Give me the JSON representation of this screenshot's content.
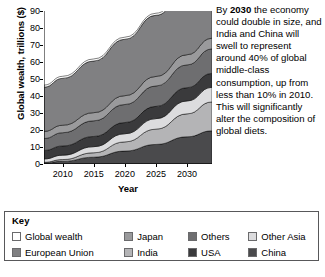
{
  "chart_data": {
    "type": "area",
    "title": "",
    "subtitle": "",
    "xlabel": "Year",
    "ylabel": "Global wealth, trillions ($)",
    "stacked": true,
    "grid": false,
    "legend_position": "bottom",
    "xlim": [
      2007,
      2034
    ],
    "ylim": [
      0,
      90
    ],
    "yticks": [
      0,
      10,
      20,
      30,
      40,
      50,
      60,
      70,
      80,
      90
    ],
    "ytick_labels": [
      "0",
      "10",
      "20",
      "30",
      "40",
      "50",
      "60",
      "70",
      "80",
      "90"
    ],
    "xticks": [
      2010,
      2015,
      2020,
      2025,
      2030
    ],
    "xtick_labels": [
      "2010",
      "2015",
      "2020",
      "2025",
      "2030"
    ],
    "x": [
      2007,
      2010,
      2015,
      2020,
      2025,
      2030,
      2034
    ],
    "series": [
      {
        "name": "China",
        "color": "#4a4a4c",
        "values": [
          0.6,
          1.6,
          4.0,
          7.6,
          11.5,
          16.0,
          19.5
        ]
      },
      {
        "name": "India",
        "color": "#b4b4b6",
        "values": [
          0.4,
          1.0,
          2.6,
          5.4,
          9.0,
          13.5,
          17.0
        ]
      },
      {
        "name": "Other Asia",
        "color": "#dcdcde",
        "values": [
          2.0,
          2.6,
          3.6,
          4.8,
          6.2,
          7.6,
          8.6
        ]
      },
      {
        "name": "USA",
        "color": "#3a3a3c",
        "values": [
          5.0,
          5.4,
          6.0,
          6.6,
          7.2,
          7.8,
          8.2
        ]
      },
      {
        "name": "Others",
        "color": "#6e6e70",
        "values": [
          7.0,
          7.8,
          9.2,
          10.6,
          12.0,
          13.4,
          14.4
        ]
      },
      {
        "name": "Japan",
        "color": "#9a9a9c",
        "values": [
          4.2,
          4.4,
          4.8,
          5.2,
          5.6,
          6.0,
          6.3
        ]
      },
      {
        "name": "European Union",
        "color": "#808082",
        "values": [
          26.0,
          27.6,
          30.4,
          33.2,
          36.0,
          38.8,
          40.8
        ]
      },
      {
        "name": "Global wealth",
        "color": "#ffffff",
        "values": [
          1.2,
          1.2,
          1.2,
          1.2,
          1.2,
          1.2,
          1.2
        ]
      }
    ],
    "annotation": "By 2030 the economy could double in size, and India and China will swell to represent around 40% of global middle-class consumption, up from less than 10% in 2010. This will significantly alter the composition of global diets."
  },
  "annotation": {
    "prefix": "By ",
    "bold": "2030",
    "rest": " the economy could double in size, and India and China will swell to represent around 40% of global middle-class consumption, up from less than 10% in 2010. This will significantly alter the composition of global diets."
  },
  "legend": {
    "title": "Key",
    "items": [
      {
        "label": "Global wealth",
        "color": "#ffffff"
      },
      {
        "label": "Japan",
        "color": "#9a9a9c"
      },
      {
        "label": "Others",
        "color": "#6e6e70"
      },
      {
        "label": "Other Asia",
        "color": "#dcdcde"
      },
      {
        "label": "European Union",
        "color": "#808082"
      },
      {
        "label": "India",
        "color": "#b4b4b6"
      },
      {
        "label": "USA",
        "color": "#3a3a3c"
      },
      {
        "label": "China",
        "color": "#4a4a4c"
      }
    ]
  }
}
